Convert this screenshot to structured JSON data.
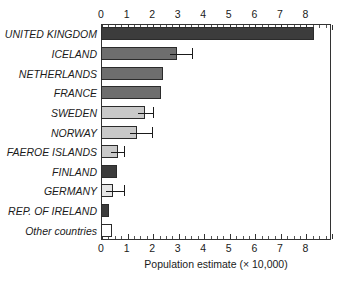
{
  "chart_data": {
    "type": "bar",
    "orientation": "horizontal",
    "title": "",
    "xlabel": "Population estimate (× 10,000)",
    "ylabel": "",
    "xlim": [
      0,
      9.0
    ],
    "grid": false,
    "legend": null,
    "axis_top_ticks": [
      "0",
      "1",
      "2",
      "3",
      "4",
      "5",
      "6",
      "7",
      "8"
    ],
    "axis_bottom_ticks": [
      "0",
      "1",
      "2",
      "3",
      "4",
      "5",
      "6",
      "7",
      "8"
    ],
    "tick_values": [
      0,
      1,
      2,
      3,
      4,
      5,
      6,
      7,
      8
    ],
    "minor_tick_step": 0.25,
    "categories": [
      "UNITED KINGDOM",
      "ICELAND",
      "NETHERLANDS",
      "FRANCE",
      "SWEDEN",
      "NORWAY",
      "FAEROE ISLANDS",
      "FINLAND",
      "GERMANY",
      "REP. OF IRELAND",
      "Other countries"
    ],
    "values": [
      8.35,
      2.98,
      2.42,
      2.35,
      1.72,
      1.41,
      0.66,
      0.64,
      0.45,
      0.33,
      0.42
    ],
    "errors_upper": [
      0,
      0.57,
      0,
      0,
      0.3,
      0.59,
      0.25,
      0,
      0.45,
      0,
      0
    ],
    "bar_colors": [
      "#3c3c3c",
      "#6e6e6e",
      "#6e6e6e",
      "#6e6e6e",
      "#c9c9c9",
      "#c9c9c9",
      "#c9c9c9",
      "#3c3c3c",
      "#e6e6e6",
      "#3c3c3c",
      "#ffffff"
    ],
    "bar_edge_color": "#2b2b2b",
    "axis_color": "#333333",
    "text_color": "#1a1a1a"
  }
}
